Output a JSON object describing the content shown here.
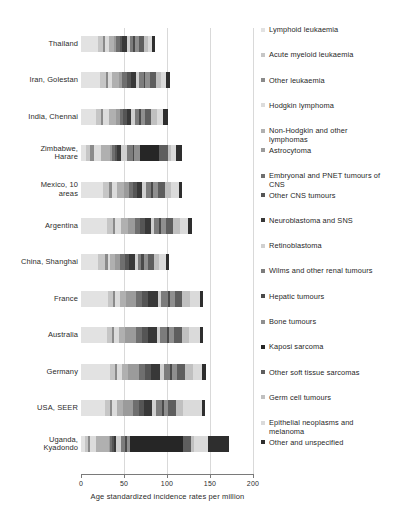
{
  "chart_data": {
    "type": "bar",
    "orientation": "horizontal",
    "stacked": true,
    "title": "",
    "xlabel": "Age standardized incidence rates per million",
    "ylabel": "",
    "xlim": [
      0,
      200
    ],
    "xticks": [
      0,
      50,
      100,
      150,
      200
    ],
    "grid": true,
    "legend_position": "right",
    "categories": [
      "Thailand",
      "Iran, Golestan",
      "India, Chennai",
      "Zimbabwe, Harare",
      "Mexico, 10 areas",
      "Argentina",
      "China, Shanghai",
      "France",
      "Australia",
      "Germany",
      "USA, SEER",
      "Uganda, Kyadondo"
    ],
    "category_lines": [
      [
        "Thailand"
      ],
      [
        "Iran, Golestan"
      ],
      [
        "India, Chennai"
      ],
      [
        "Zimbabwe,",
        "Harare"
      ],
      [
        "Mexico, 10",
        "areas"
      ],
      [
        "Argentina"
      ],
      [
        "China, Shanghai"
      ],
      [
        "France"
      ],
      [
        "Australia"
      ],
      [
        "Germany"
      ],
      [
        "USA, SEER"
      ],
      [
        "Uganda,",
        "Kyadondo"
      ]
    ],
    "series": [
      {
        "name": "Lymphoid leukaemia",
        "color": "#e2e2e2",
        "values": [
          20.0,
          22.0,
          17.0,
          6.0,
          26.0,
          30.0,
          20.0,
          31.0,
          30.0,
          34.0,
          28.0,
          5.0
        ]
      },
      {
        "name": "Acute myeloid leukaemia",
        "color": "#c6c6c6",
        "values": [
          6.0,
          7.0,
          6.0,
          5.0,
          7.0,
          7.0,
          8.0,
          6.0,
          6.0,
          6.0,
          6.0,
          3.0
        ]
      },
      {
        "name": "Other leukaemia",
        "color": "#8a8a8a",
        "values": [
          2.0,
          2.0,
          3.0,
          4.0,
          3.0,
          3.0,
          3.0,
          2.0,
          2.0,
          2.0,
          2.0,
          2.0
        ]
      },
      {
        "name": "Hodgkin lymphoma",
        "color": "#dcdcdc",
        "values": [
          4.0,
          5.0,
          6.0,
          8.0,
          6.0,
          7.0,
          3.0,
          6.0,
          6.0,
          6.0,
          6.0,
          8.0
        ]
      },
      {
        "name": "Non-Hodgkin and other lymphomas",
        "color": "#b0b0b0",
        "values": [
          6.0,
          8.0,
          9.0,
          11.0,
          8.0,
          8.0,
          6.0,
          7.0,
          7.0,
          7.0,
          7.0,
          14.0
        ]
      },
      {
        "name": "Astrocytoma",
        "color": "#9b9b9b",
        "values": [
          3.0,
          4.0,
          4.0,
          2.0,
          6.0,
          8.0,
          5.0,
          12.0,
          13.0,
          12.0,
          12.0,
          2.0
        ]
      },
      {
        "name": "Embryonal and PNET tumours of CNS",
        "color": "#6f6f6f",
        "values": [
          4.0,
          5.0,
          4.0,
          3.0,
          5.0,
          6.0,
          6.0,
          7.0,
          7.0,
          7.0,
          6.0,
          2.0
        ]
      },
      {
        "name": "Other CNS tumours",
        "color": "#555555",
        "values": [
          3.0,
          5.0,
          4.0,
          3.0,
          4.0,
          5.0,
          5.0,
          7.0,
          7.0,
          7.0,
          6.0,
          2.0
        ]
      },
      {
        "name": "Neuroblastoma and SNS",
        "color": "#383838",
        "values": [
          5.0,
          6.0,
          5.0,
          4.0,
          6.0,
          7.0,
          7.0,
          11.0,
          10.0,
          11.0,
          10.0,
          3.0
        ]
      },
      {
        "name": "Retinoblastoma",
        "color": "#d0d0d0",
        "values": [
          4.0,
          4.0,
          5.0,
          7.0,
          5.0,
          4.0,
          3.0,
          4.0,
          4.0,
          4.0,
          4.0,
          5.0
        ]
      },
      {
        "name": "Wilms and other renal tumours",
        "color": "#7c7c7c",
        "values": [
          4.0,
          5.0,
          5.0,
          7.0,
          6.0,
          6.0,
          4.0,
          8.0,
          8.0,
          8.0,
          7.0,
          5.0
        ]
      },
      {
        "name": "Hepatic tumours",
        "color": "#4a4a4a",
        "values": [
          2.0,
          2.0,
          2.0,
          2.0,
          2.0,
          2.0,
          3.0,
          2.0,
          2.0,
          2.0,
          2.0,
          2.0
        ]
      },
      {
        "name": "Bone tumours",
        "color": "#8f8f8f",
        "values": [
          4.0,
          5.0,
          5.0,
          7.0,
          6.0,
          6.0,
          5.0,
          6.0,
          6.0,
          6.0,
          5.0,
          4.0
        ]
      },
      {
        "name": "Kaposi sarcoma",
        "color": "#262626",
        "values": [
          0.0,
          0.0,
          0.0,
          22.0,
          0.0,
          0.0,
          0.0,
          0.0,
          0.0,
          0.0,
          0.0,
          62.0
        ]
      },
      {
        "name": "Other soft tissue sarcomas",
        "color": "#5e5e5e",
        "values": [
          6.0,
          7.0,
          7.0,
          10.0,
          8.0,
          8.0,
          7.0,
          9.0,
          9.0,
          9.0,
          9.0,
          9.0
        ]
      },
      {
        "name": "Germ cell tumours",
        "color": "#c0c0c0",
        "values": [
          5.0,
          6.0,
          6.0,
          4.0,
          7.0,
          8.0,
          6.0,
          9.0,
          9.0,
          9.0,
          9.0,
          4.0
        ]
      },
      {
        "name": "Epithelial neoplasms and melanoma",
        "color": "#dadada",
        "values": [
          5.0,
          6.0,
          7.0,
          6.0,
          9.0,
          10.0,
          8.0,
          11.0,
          12.0,
          11.0,
          22.0,
          16.0
        ]
      },
      {
        "name": "Other and unspecified",
        "color": "#2e2e2e",
        "values": [
          3.0,
          4.0,
          6.0,
          7.0,
          4.0,
          4.0,
          3.0,
          4.0,
          4.0,
          4.0,
          3.0,
          24.0
        ]
      }
    ],
    "legend_entries": [
      {
        "label": "Lymphoid leukaemia",
        "color": "#e2e2e2",
        "lines": [
          "Lymphoid leukaemia"
        ]
      },
      {
        "label": "Acute myeloid leukaemia",
        "color": "#c6c6c6",
        "lines": [
          "Acute myeloid leukaemia"
        ]
      },
      {
        "label": "Other leukaemia",
        "color": "#8a8a8a",
        "lines": [
          "Other leukaemia"
        ]
      },
      {
        "label": "Hodgkin lymphoma",
        "color": "#dcdcdc",
        "lines": [
          "Hodgkin lymphoma"
        ]
      },
      {
        "label": "Non-Hodgkin and other lymphomas",
        "color": "#b0b0b0",
        "lines": [
          "Non-Hodgkin and other",
          "lymphomas"
        ]
      },
      {
        "label": "Astrocytoma",
        "color": "#9b9b9b",
        "lines": [
          "Astrocytoma"
        ]
      },
      {
        "label": "Embryonal and PNET tumours of CNS",
        "color": "#6f6f6f",
        "lines": [
          "Embryonal and PNET tumours of",
          "CNS"
        ]
      },
      {
        "label": "Other CNS tumours",
        "color": "#555555",
        "lines": [
          "Other CNS tumours"
        ]
      },
      {
        "label": "Neuroblastoma and SNS",
        "color": "#383838",
        "lines": [
          "Neuroblastoma and SNS"
        ]
      },
      {
        "label": "Retinoblastoma",
        "color": "#d0d0d0",
        "lines": [
          "Retinoblastoma"
        ]
      },
      {
        "label": "Wilms and other renal tumours",
        "color": "#7c7c7c",
        "lines": [
          "Wilms and other renal tumours"
        ]
      },
      {
        "label": "Hepatic tumours",
        "color": "#4a4a4a",
        "lines": [
          "Hepatic tumours"
        ]
      },
      {
        "label": "Bone tumours",
        "color": "#8f8f8f",
        "lines": [
          "Bone tumours"
        ]
      },
      {
        "label": "Kaposi sarcoma",
        "color": "#262626",
        "lines": [
          "Kaposi sarcoma"
        ]
      },
      {
        "label": "Other soft tissue sarcomas",
        "color": "#5e5e5e",
        "lines": [
          "Other soft tissue sarcomas"
        ]
      },
      {
        "label": "Germ cell tumours",
        "color": "#c0c0c0",
        "lines": [
          "Germ cell tumours"
        ]
      },
      {
        "label": "Epithelial neoplasms and melanoma",
        "color": "#dadada",
        "lines": [
          "Epithelial neoplasms and",
          "melanoma"
        ]
      },
      {
        "label": "Other and unspecified",
        "color": "#2e2e2e",
        "lines": [
          "Other and unspecified"
        ]
      }
    ]
  }
}
